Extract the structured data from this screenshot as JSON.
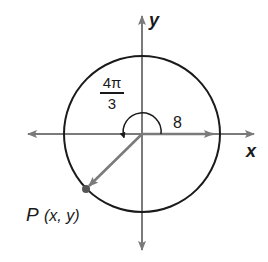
{
  "diagram": {
    "type": "unit-circle-angle",
    "axes": {
      "x_label": "x",
      "y_label": "y"
    },
    "circle": {
      "radius_label": "8"
    },
    "angle": {
      "numerator": "4π",
      "denominator": "3",
      "value": "4π/3"
    },
    "point": {
      "label_name": "P",
      "label_coords": "(x, y)"
    },
    "colors": {
      "axis": "#7a7a7a",
      "circle": "#1a1a1a",
      "text": "#1a1a1a"
    }
  }
}
